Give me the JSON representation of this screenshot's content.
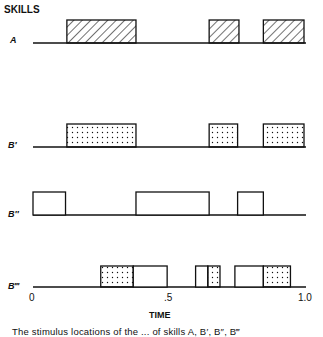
{
  "title": "SKILLS",
  "axis": {
    "label": "TIME",
    "ticks": [
      {
        "value": 0,
        "label": "0"
      },
      {
        "value": 0.5,
        "label": ".5"
      },
      {
        "value": 1.0,
        "label": "1.0"
      }
    ],
    "range": [
      0,
      1.0
    ]
  },
  "rows": [
    {
      "label": "A",
      "segments": [
        {
          "start": 0.125,
          "end": 0.38,
          "fill": "hatched"
        },
        {
          "start": 0.65,
          "end": 0.76,
          "fill": "hatched"
        },
        {
          "start": 0.85,
          "end": 1.0,
          "fill": "hatched"
        }
      ]
    },
    {
      "label": "B′",
      "segments": [
        {
          "start": 0.125,
          "end": 0.38,
          "fill": "dotted"
        },
        {
          "start": 0.65,
          "end": 0.755,
          "fill": "dotted"
        },
        {
          "start": 0.85,
          "end": 1.0,
          "fill": "dotted"
        }
      ]
    },
    {
      "label": "B″",
      "segments": [
        {
          "start": 0.0,
          "end": 0.12,
          "fill": "empty"
        },
        {
          "start": 0.38,
          "end": 0.65,
          "fill": "empty"
        },
        {
          "start": 0.755,
          "end": 0.85,
          "fill": "empty"
        }
      ]
    },
    {
      "label": "B‴",
      "segments": [
        {
          "start": 0.25,
          "end": 0.37,
          "fill": "dotted"
        },
        {
          "start": 0.37,
          "end": 0.495,
          "fill": "empty"
        },
        {
          "start": 0.6,
          "end": 0.645,
          "fill": "empty"
        },
        {
          "start": 0.645,
          "end": 0.69,
          "fill": "dotted"
        },
        {
          "start": 0.745,
          "end": 0.85,
          "fill": "empty"
        },
        {
          "start": 0.85,
          "end": 0.95,
          "fill": "dotted"
        }
      ]
    }
  ],
  "caption": "The stimulus locations of the ... of skills A, B′, B″, B‴"
}
